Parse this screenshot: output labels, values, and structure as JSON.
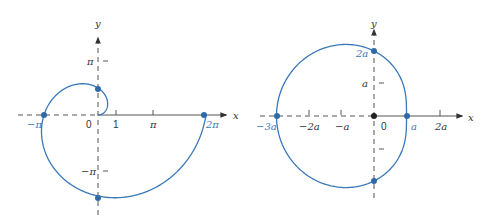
{
  "colors": {
    "curve": "#3a78b8",
    "axis": "#555555",
    "text": "#333333"
  },
  "left_plot": {
    "description": "Archimedean spiral r = theta",
    "x_axis_label": "x",
    "y_axis_label": "y",
    "origin_label": "0",
    "x_ticks": [
      "1",
      "π"
    ],
    "y_ticks": [
      "π",
      "−π"
    ],
    "marked_points": [
      {
        "label": "−π",
        "note": "on negative x-axis"
      },
      {
        "label": "2π",
        "note": "on positive x-axis"
      },
      {
        "label": "",
        "note": "on positive y-axis (π/2)"
      },
      {
        "label": "",
        "note": "on negative y-axis (−3π/2)"
      }
    ]
  },
  "right_plot": {
    "description": "Limaçon r = a(2 − cos θ)",
    "x_axis_label": "x",
    "y_axis_label": "y",
    "origin_label": "0",
    "x_ticks": [
      "−2a",
      "−a",
      "2a"
    ],
    "y_ticks": [
      "a"
    ],
    "marked_points": [
      {
        "label": "−3a",
        "note": "on negative x-axis"
      },
      {
        "label": "a",
        "note": "on positive x-axis"
      },
      {
        "label": "2a",
        "note": "on positive y-axis"
      },
      {
        "label": "",
        "note": "on negative y-axis"
      }
    ]
  }
}
